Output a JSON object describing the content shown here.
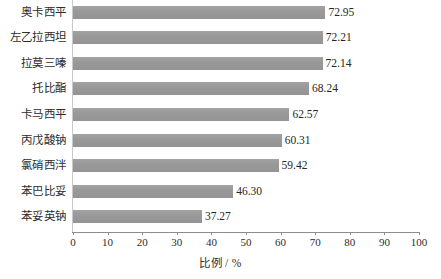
{
  "chart_data": {
    "type": "bar",
    "orientation": "horizontal",
    "title": "",
    "xlabel": "比例 / %",
    "ylabel": "",
    "xlim": [
      0,
      100
    ],
    "xticks": [
      0,
      10,
      20,
      30,
      40,
      50,
      60,
      70,
      80,
      90,
      100
    ],
    "grid": false,
    "legend": false,
    "bar_color": "#9b9b9b",
    "categories": [
      "奥卡西平",
      "左乙拉西坦",
      "拉莫三嗪",
      "托比酯",
      "卡马西平",
      "丙戊酸钠",
      "氯硝西泮",
      "苯巴比妥",
      "苯妥英钠"
    ],
    "values": [
      72.95,
      72.21,
      72.14,
      68.24,
      62.57,
      60.31,
      59.42,
      46.3,
      37.27
    ],
    "value_labels": [
      "72.95",
      "72.21",
      "72.14",
      "68.24",
      "62.57",
      "60.31",
      "59.42",
      "46.30",
      "37.27"
    ],
    "tick_labels": [
      "0",
      "10",
      "20",
      "30",
      "40",
      "50",
      "60",
      "70",
      "80",
      "90",
      "100"
    ]
  }
}
